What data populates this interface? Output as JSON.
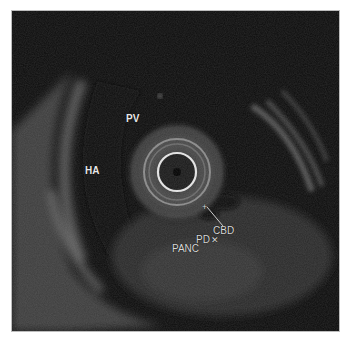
{
  "image": {
    "type": "endoscopic-ultrasound",
    "background_color": "#ffffff",
    "frame_color": "#0c0c0c",
    "ring_color": "#e6e6e6"
  },
  "labels": {
    "pv": "PV",
    "ha": "HA",
    "cbd": "CBD",
    "pd": "PD",
    "panc": "PANC",
    "cbd_marker": "+",
    "pd_marker": "✕"
  }
}
